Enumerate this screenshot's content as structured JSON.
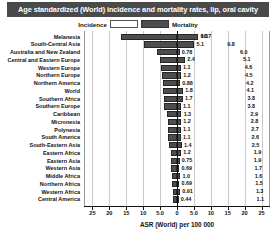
{
  "title": "Age standardized (World) incidence and mortality rates, lip, oral cavity",
  "legend": {
    "incidence_label": "Incidence",
    "mortality_label": "Mortality",
    "incidence_color": "#4d4d4d",
    "mortality_color": "#4d4d4d"
  },
  "xaxis": {
    "title": "ASR (World) per 100 000",
    "ticks": [
      "25",
      "20",
      "15",
      "10",
      "5.0",
      "0",
      "5.0",
      "10",
      "15",
      "20",
      "25"
    ],
    "tick_values": [
      -25,
      -20,
      -15,
      -10,
      -5,
      0,
      5,
      10,
      15,
      20,
      25
    ],
    "max": 27.5
  },
  "chart_data": {
    "type": "bar",
    "orientation": "horizontal-diverging",
    "title": "Age standardized (World) incidence and mortality rates, lip, oral cavity",
    "xlabel": "ASR (World) per 100 000",
    "ylabel": "",
    "xlim": [
      -27.5,
      27.5
    ],
    "grid": true,
    "legend_position": "top-center",
    "categories": [
      "Melanesia",
      "South-Central Asia",
      "Australia and New Zealand",
      "Central and Eastern Europe",
      "Western Europe",
      "Northern  Europe",
      "Northern  America",
      "World",
      "Southern  Africa",
      "Southern  Europe",
      "Caribbean",
      "Micronesia",
      "Polynesia",
      "South America",
      "South-Eastern Asia",
      "Eastern Africa",
      "Eastern Asia",
      "Western Asia",
      "Middle Africa",
      "Northern Africa",
      "Western Africa",
      "Central America"
    ],
    "series": [
      {
        "name": "Incidence",
        "values": [
          16.7,
          9.8,
          6.0,
          5.1,
          4.6,
          4.5,
          4.2,
          4.1,
          3.8,
          3.8,
          2.9,
          2.8,
          2.7,
          2.6,
          2.5,
          1.9,
          1.9,
          1.7,
          1.6,
          1.5,
          1.3,
          1.1
        ]
      },
      {
        "name": "Mortality",
        "values": [
          6.3,
          5.1,
          0.78,
          2.4,
          1.1,
          1.2,
          0.88,
          1.8,
          1.7,
          1.1,
          1.3,
          1.2,
          1.1,
          1.1,
          1.4,
          1.2,
          0.75,
          0.69,
          1.0,
          0.69,
          0.91,
          0.44
        ]
      }
    ],
    "incidence_labels": [
      "16.7",
      "9.8",
      "6.0",
      "5.1",
      "4.6",
      "4.5",
      "4.2",
      "4.1",
      "3.8",
      "3.8",
      "2.9",
      "2.8",
      "2.7",
      "2.6",
      "2.5",
      "1.9",
      "1.9",
      "1.7",
      "1.6",
      "1.5",
      "1.3",
      "1.1"
    ],
    "mortality_labels": [
      "6.3",
      "5.1",
      "0.78",
      "2.4",
      "1.1",
      "1.2",
      "0.88",
      "1.8",
      "1.7",
      "1.1",
      "1.3",
      "1.2",
      "1.1",
      "1.1",
      "1.4",
      "1.2",
      "0.75",
      "0.69",
      "1.0",
      "0.69",
      "0.91",
      "0.44"
    ]
  }
}
